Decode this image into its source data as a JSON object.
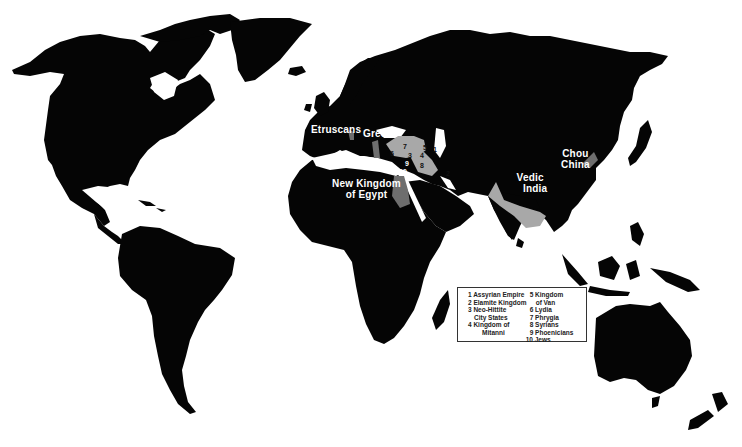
{
  "map": {
    "title": "",
    "colors": {
      "land": "#050505",
      "ocean": "#ffffff",
      "highlight_light": "#a8a8a8",
      "highlight_mid": "#8a8a8a",
      "highlight_dark": "#6e6e6e"
    },
    "labels": {
      "etruscans": "Etruscans",
      "greeks": "Greeks",
      "egypt_line1": "New Kingdom",
      "egypt_line2": "of Egypt",
      "india_line1": "Vedic",
      "india_line2": "India",
      "china_line1": "Chou",
      "china_line2": "China"
    },
    "region_numbers": [
      "1",
      "2",
      "3",
      "4",
      "5",
      "6",
      "7",
      "8",
      "9",
      "10"
    ]
  },
  "legend": {
    "items": [
      {
        "num": "1",
        "label": "Assyrian Empire"
      },
      {
        "num": "2",
        "label": "Elamite Kingdom"
      },
      {
        "num": "3",
        "label": "Neo-Hittite",
        "cont": "City States"
      },
      {
        "num": "4",
        "label": "Kingdom of",
        "cont": "Mitanni"
      },
      {
        "num": "5",
        "label": "Kingdom",
        "cont": "of Van"
      },
      {
        "num": "6",
        "label": "Lydia"
      },
      {
        "num": "7",
        "label": "Phrygia"
      },
      {
        "num": "8",
        "label": "Syrians"
      },
      {
        "num": "9",
        "label": "Phoenicians"
      },
      {
        "num": "10",
        "label": "Jews"
      }
    ],
    "lines": {
      "i1": "1 Assyrian Empire",
      "i2": "2 Elamite Kingdom",
      "i3a": "3 Neo-Hittite",
      "i3b": "City States",
      "i4a": "4 Kingdom of",
      "i4b": "Mitanni",
      "i5a": "5 Kingdom",
      "i5b": "of Van",
      "i6": "6 Lydia",
      "i7": "7 Phrygia",
      "i8": "8 Syrians",
      "i9": "9 Phoenicians",
      "i10": "10 Jews"
    }
  }
}
